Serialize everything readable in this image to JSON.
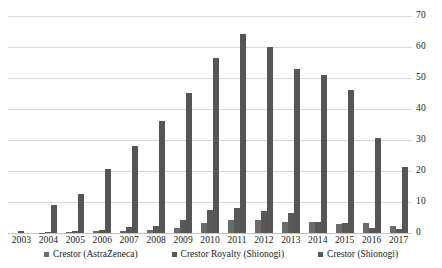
{
  "chart_data": {
    "type": "bar",
    "title": "",
    "subtitle": "",
    "xlabel": "",
    "ylabel": "",
    "ylim": [
      0,
      70
    ],
    "ytick_step": 10,
    "yticks": [
      70,
      60,
      50,
      40,
      30,
      20,
      10,
      0
    ],
    "grid": true,
    "legend_position": "bottom",
    "categories": [
      "2003",
      "2004",
      "2005",
      "2006",
      "2007",
      "2008",
      "2009",
      "2010",
      "2011",
      "2012",
      "2013",
      "2014",
      "2015",
      "2016",
      "2017"
    ],
    "series": [
      {
        "name": "Crestor (AstraZeneca)",
        "color": "#6b6b6b",
        "values": [
          0.0,
          0.1,
          0.2,
          0.6,
          0.7,
          1.1,
          1.7,
          3.1,
          4.2,
          4.2,
          3.7,
          3.4,
          2.9,
          3.2,
          2.2
        ]
      },
      {
        "name": "Crestor Royalty (Shionogi)",
        "color": "#585858",
        "values": [
          0.5,
          0.2,
          0.5,
          1.1,
          2.0,
          2.4,
          4.2,
          7.3,
          8.1,
          7.1,
          6.3,
          3.7,
          3.1,
          1.6,
          1.2
        ]
      },
      {
        "name": "Crestor (Shionogi)",
        "color": "#565656",
        "values": [
          0.0,
          9.1,
          12.6,
          20.7,
          28.2,
          36.1,
          45.1,
          56.5,
          64.2,
          60.0,
          53.0,
          51.0,
          46.0,
          30.7,
          21.2
        ]
      }
    ]
  },
  "legend": {
    "items": [
      {
        "label": "Crestor (AstraZeneca)"
      },
      {
        "label": "Crestor Royalty (Shionogi)"
      },
      {
        "label": "Crestor (Shionogi)"
      }
    ]
  },
  "colors": {
    "bar_primary": "#595959",
    "gridline": "#d9d9d9",
    "text": "#222222",
    "background": "#ffffff"
  }
}
